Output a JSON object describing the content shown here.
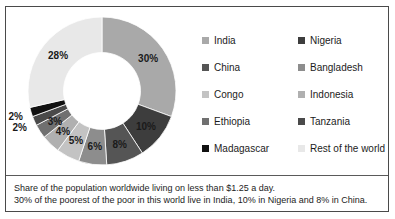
{
  "chart_data": {
    "type": "pie",
    "variant": "donut",
    "title": "",
    "categories": [
      "India",
      "Nigeria",
      "China",
      "Bangladesh",
      "Congo",
      "Indonesia",
      "Ethiopia",
      "Tanzania",
      "Madagascar",
      "Rest of the world"
    ],
    "values": [
      30,
      10,
      8,
      6,
      5,
      4,
      3,
      2,
      2,
      28
    ],
    "value_labels": [
      "30%",
      "10%",
      "8%",
      "6%",
      "5%",
      "4%",
      "3%",
      "2%",
      "2%",
      "28%"
    ],
    "colors": [
      "#a9a9a9",
      "#3d3d3d",
      "#555555",
      "#8d8d8d",
      "#c3c3c3",
      "#b0b0b0",
      "#707070",
      "#4a4a4a",
      "#111111",
      "#e8e8e8"
    ],
    "label_outside": [
      false,
      false,
      false,
      false,
      false,
      false,
      false,
      true,
      true,
      false
    ],
    "start_angle": 0,
    "direction": "clockwise",
    "inner_radius_ratio": 0.52,
    "legend_position": "right",
    "xlabel": "",
    "ylabel": ""
  },
  "legend": {
    "items": [
      {
        "label": "India",
        "color": "#a9a9a9"
      },
      {
        "label": "Nigeria",
        "color": "#3d3d3d"
      },
      {
        "label": "China",
        "color": "#555555"
      },
      {
        "label": "Bangladesh",
        "color": "#8d8d8d"
      },
      {
        "label": "Congo",
        "color": "#c3c3c3"
      },
      {
        "label": "Indonesia",
        "color": "#b0b0b0"
      },
      {
        "label": "Ethiopia",
        "color": "#707070"
      },
      {
        "label": "Tanzania",
        "color": "#4a4a4a"
      },
      {
        "label": "Madagascar",
        "color": "#111111"
      },
      {
        "label": "Rest of the world",
        "color": "#e8e8e8"
      }
    ]
  },
  "caption": {
    "line1": "Share of the population worldwide living on less than $1.25 a day.",
    "line2": "30% of the poorest of the poor in this world live in India, 10% in Nigeria and 8% in China."
  }
}
